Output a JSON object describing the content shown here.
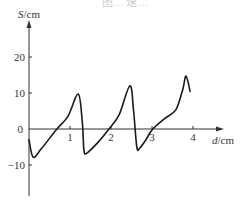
{
  "figure": {
    "caption_partial": "图… 速…",
    "background": "#ffffff",
    "line_color": "#1a1a1a",
    "axis_color": "#333333"
  },
  "chart_data": {
    "type": "line",
    "title": "",
    "xlabel": "d/cm",
    "ylabel": "S/cm",
    "x_ticks": [
      1,
      2,
      3,
      4
    ],
    "y_ticks": [
      -10,
      0,
      10,
      20
    ],
    "origin_label": "0",
    "xlim": [
      0,
      4.6
    ],
    "ylim": [
      -18,
      30
    ],
    "grid": false,
    "legend": null,
    "series": [
      {
        "name": "S(d)",
        "x": [
          0,
          0.1,
          0.3,
          0.68,
          0.95,
          1.2,
          1.3,
          1.34,
          1.41,
          1.7,
          1.95,
          2.2,
          2.46,
          2.55,
          2.63,
          2.7,
          2.85,
          3.02,
          3.3,
          3.58,
          3.75,
          3.83,
          3.93
        ],
        "y": [
          -3,
          -7.8,
          -5.5,
          0,
          3.5,
          9.7,
          2,
          -5.8,
          -6.7,
          -3.5,
          0,
          4,
          12,
          5,
          -5,
          -5.3,
          -3,
          0,
          2.8,
          5.3,
          11,
          14.7,
          10.5
        ]
      }
    ]
  }
}
